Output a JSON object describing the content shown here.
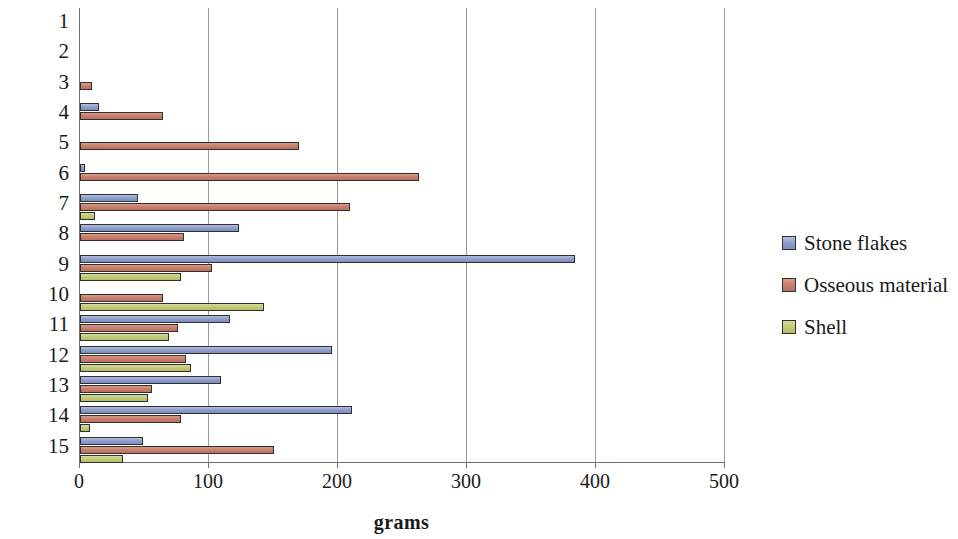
{
  "chart_data": {
    "type": "bar",
    "orientation": "horizontal",
    "title": "",
    "xlabel": "grams",
    "ylabel": "Spit",
    "xlim": [
      0,
      500
    ],
    "xticks": [
      0,
      100,
      200,
      300,
      400,
      500
    ],
    "xtick_labels": [
      "0",
      "100",
      "200",
      "300",
      "400",
      "500"
    ],
    "grid": "vertical",
    "legend_position": "right",
    "categories": [
      "1",
      "2",
      "3",
      "4",
      "5",
      "6",
      "7",
      "8",
      "9",
      "10",
      "11",
      "12",
      "13",
      "14",
      "15"
    ],
    "series": [
      {
        "name": "Stone flakes",
        "color": "#8e9dcb",
        "values": [
          0,
          0,
          0,
          15,
          0,
          4,
          45,
          123,
          384,
          0,
          116,
          195,
          109,
          211,
          49
        ]
      },
      {
        "name": "Osseous material",
        "color": "#c67f6b",
        "values": [
          0,
          0,
          9,
          64,
          170,
          263,
          209,
          81,
          102,
          64,
          76,
          82,
          56,
          78,
          150
        ]
      },
      {
        "name": "Shell",
        "color": "#c0c977",
        "values": [
          0,
          0,
          0,
          0,
          0,
          0,
          12,
          0,
          78,
          143,
          69,
          86,
          53,
          8,
          33
        ]
      }
    ]
  },
  "legend": {
    "items": [
      {
        "label": "Stone flakes",
        "swatch": "stone"
      },
      {
        "label": "Osseous material",
        "swatch": "osseous"
      },
      {
        "label": "Shell",
        "swatch": "shell"
      }
    ]
  }
}
